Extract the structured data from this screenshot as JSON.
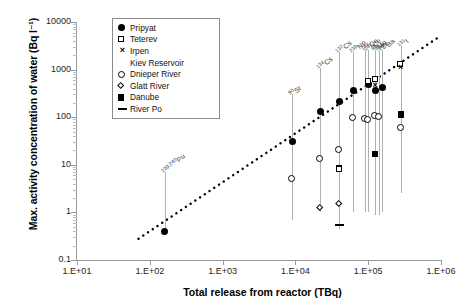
{
  "chart_data": {
    "type": "scatter",
    "title": "",
    "xlabel": "Total release from reactor (TBq)",
    "ylabel": "Max. activity concentration of water (Bq l⁻¹)",
    "xscale": "log",
    "yscale": "log",
    "xlim": [
      10,
      1000000
    ],
    "ylim": [
      0.1,
      10000
    ],
    "xticklabels": [
      "1.E+01",
      "1.E+02",
      "1.E+03",
      "1.E+04",
      "1.E+05",
      "1.E+06"
    ],
    "xtickvalues": [
      10,
      100,
      1000,
      10000,
      100000,
      1000000
    ],
    "yticklabels": [
      "0.1",
      "1",
      "10",
      "100",
      "1000",
      "10000"
    ],
    "ytickvalues": [
      0.1,
      1,
      10,
      100,
      1000,
      10000
    ],
    "grid": false,
    "legend_position": "upper-left-inside",
    "legend": [
      {
        "label": "Pripyat",
        "marker": "filled-circle"
      },
      {
        "label": "Teterev",
        "marker": "open-square"
      },
      {
        "label": "Irpen",
        "marker": "cross"
      },
      {
        "label": "Kiev Reservoir",
        "marker": "filled-triangle"
      },
      {
        "label": "Dnieper River",
        "marker": "open-circle"
      },
      {
        "label": "Glatt River",
        "marker": "open-diamond"
      },
      {
        "label": "Danube",
        "marker": "filled-square"
      },
      {
        "label": "River Po",
        "marker": "dash"
      }
    ],
    "annotations": [
      {
        "text": "239,240Pu",
        "sup": "239,240",
        "base": "Pu",
        "x": 160
      },
      {
        "text": "90Sr",
        "sup": "90",
        "base": "Sr",
        "x": 9000
      },
      {
        "text": "134Cs",
        "sup": "134",
        "base": "Cs",
        "x": 22000
      },
      {
        "text": "137Cs",
        "sup": "137",
        "base": "Cs",
        "x": 40000
      },
      {
        "text": "239Np",
        "sup": "239",
        "base": "Np",
        "x": 62000
      },
      {
        "text": "144Ce",
        "sup": "144",
        "base": "Ce",
        "x": 90000
      },
      {
        "text": "141Ce",
        "sup": "141",
        "base": "Ce",
        "x": 100000
      },
      {
        "text": "99Mo",
        "sup": "99",
        "base": "Mo",
        "x": 125000
      },
      {
        "text": "95Zr",
        "sup": "95",
        "base": "Zr",
        "x": 140000
      },
      {
        "text": "140Ba",
        "sup": "140",
        "base": "Ba",
        "x": 155000
      },
      {
        "text": "131I",
        "sup": "131",
        "base": "I",
        "x": 280000
      }
    ],
    "trendline": {
      "style": "dotted",
      "color": "#000000",
      "x0": 70,
      "y0": 0.28,
      "x1": 1000000,
      "y1": 5200
    },
    "isotope_groups": [
      {
        "isotope": "239,240Pu",
        "x": 160,
        "span": [
          0.4,
          7
        ],
        "points": [
          {
            "series": "Pripyat",
            "marker": "filled-circle",
            "y": 0.4
          }
        ]
      },
      {
        "isotope": "90Sr",
        "x": 9000,
        "span": [
          0.7,
          300
        ],
        "points": [
          {
            "series": "Pripyat",
            "marker": "filled-circle",
            "y": 31
          },
          {
            "series": "Dnieper River",
            "marker": "open-circle",
            "y": 5.0
          }
        ]
      },
      {
        "isotope": "134Cs",
        "x": 22000,
        "span": [
          1.0,
          1100
        ],
        "points": [
          {
            "series": "Pripyat",
            "marker": "filled-circle",
            "y": 130
          },
          {
            "series": "Dnieper River",
            "marker": "open-circle",
            "y": 13
          },
          {
            "series": "Glatt River",
            "marker": "open-diamond",
            "y": 1.2
          }
        ]
      },
      {
        "isotope": "137Cs",
        "x": 40000,
        "span": [
          0.45,
          2400
        ],
        "points": [
          {
            "series": "Pripyat",
            "marker": "filled-circle",
            "y": 210
          },
          {
            "series": "Dnieper River",
            "marker": "open-circle",
            "y": 20
          },
          {
            "series": "Danube",
            "marker": "filled-square",
            "y": 8.5
          },
          {
            "series": "Teterev",
            "marker": "open-square",
            "y": 8.0
          },
          {
            "series": "Glatt River",
            "marker": "open-diamond",
            "y": 1.5
          },
          {
            "series": "River Po",
            "marker": "dash",
            "y": 0.55
          }
        ]
      },
      {
        "isotope": "239Np",
        "x": 62000,
        "span": [
          1.0,
          2400
        ],
        "points": [
          {
            "series": "Pripyat",
            "marker": "filled-circle",
            "y": 370
          },
          {
            "series": "Kiev Reservoir",
            "marker": "filled-triangle",
            "y": 160
          },
          {
            "series": "Dnieper River",
            "marker": "open-circle",
            "y": 95
          }
        ]
      },
      {
        "isotope": "144Ce",
        "x": 90000,
        "span": [
          1.0,
          2600
        ],
        "points": [
          {
            "series": "Dnieper River",
            "marker": "open-circle",
            "y": 90
          }
        ]
      },
      {
        "isotope": "141Ce",
        "x": 100000,
        "span": [
          1.0,
          2600
        ],
        "points": [
          {
            "series": "Pripyat",
            "marker": "filled-circle",
            "y": 480
          },
          {
            "series": "Teterev",
            "marker": "open-square",
            "y": 560
          },
          {
            "series": "Dnieper River",
            "marker": "open-circle",
            "y": 88
          }
        ]
      },
      {
        "isotope": "99Mo",
        "x": 125000,
        "span": [
          0.9,
          2600
        ],
        "points": [
          {
            "series": "Teterev",
            "marker": "open-square",
            "y": 620
          },
          {
            "series": "Irpen",
            "marker": "cross",
            "y": 460
          },
          {
            "series": "Pripyat",
            "marker": "filled-circle",
            "y": 370
          },
          {
            "series": "Dnieper River",
            "marker": "open-circle",
            "y": 105
          },
          {
            "series": "Danube",
            "marker": "filled-square",
            "y": 17
          }
        ]
      },
      {
        "isotope": "95Zr",
        "x": 140000,
        "span": [
          0.9,
          2600
        ],
        "points": [
          {
            "series": "Kiev Reservoir",
            "marker": "filled-triangle",
            "y": 400
          },
          {
            "series": "Dnieper River",
            "marker": "open-circle",
            "y": 100
          },
          {
            "series": "Dnieper River",
            "marker": "open-down-triangle",
            "y": 1.4
          }
        ]
      },
      {
        "isotope": "140Ba",
        "x": 155000,
        "span": [
          1.0,
          2600
        ],
        "points": [
          {
            "series": "Pripyat",
            "marker": "filled-circle",
            "y": 420
          }
        ]
      },
      {
        "isotope": "131I",
        "x": 280000,
        "span": [
          2.5,
          3200
        ],
        "points": [
          {
            "series": "Teterev",
            "marker": "open-square",
            "y": 1250
          },
          {
            "series": "Irpen",
            "marker": "cross",
            "y": 1100
          },
          {
            "series": "Kiev Reservoir",
            "marker": "filled-triangle",
            "y": 800
          },
          {
            "series": "Danube",
            "marker": "filled-square",
            "y": 115
          },
          {
            "series": "Dnieper River",
            "marker": "open-circle",
            "y": 60
          },
          {
            "series": "Dnieper River",
            "marker": "open-down-triangle",
            "y": 5.5
          }
        ]
      }
    ]
  }
}
